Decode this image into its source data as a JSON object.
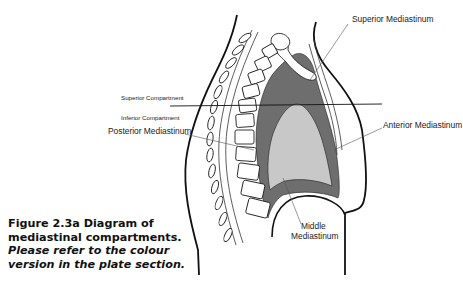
{
  "figure": {
    "title": "Figure 2.3a Diagram of mediastinal compartments.",
    "note": "Please refer to the colour version in the plate section."
  },
  "labels": {
    "superior_mediastinum": "Superior Mediastinum",
    "superior_compartment": "Superior Compartment",
    "inferior_compartment": "Inferior Compartment",
    "posterior_mediastinum": "Posterior Mediastinum",
    "anterior_mediastinum": "Anterior Mediastinum",
    "middle_mediastinum_line1": "Middle",
    "middle_mediastinum_line2": "Mediastinum"
  },
  "colors": {
    "outline": "#111111",
    "mediastinum_dark": "#6e6e6e",
    "heart_light": "#c8c8c8",
    "leader": "#555555"
  }
}
